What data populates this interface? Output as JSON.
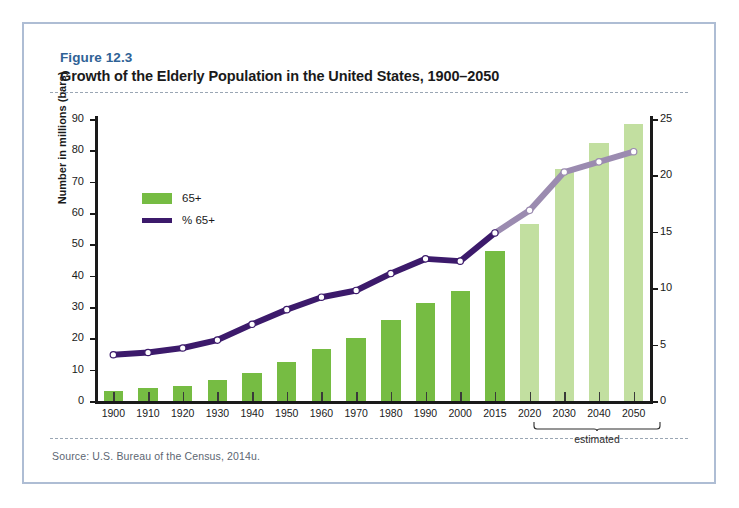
{
  "figure": {
    "number": "Figure 12.3",
    "title": "Growth of the Elderly Population in the United States, 1900–2050",
    "source": "Source:  U.S. Bureau of the Census, 2014u."
  },
  "annotations": {
    "estimated_label": "estimated",
    "estimated_years": [
      "2020",
      "2030",
      "2040",
      "2050"
    ]
  },
  "colors": {
    "bar_actual": "#76bc43",
    "bar_projected": "#c2dfa0",
    "line_actual": "#3c1a6b",
    "line_projected": "#9b8bb0",
    "frame": "#aebdd4",
    "figure_number": "#2f6296",
    "gridline": "#e2e2e2",
    "source_text": "#5c6672"
  },
  "chart_data": {
    "type": "bar",
    "title": "Growth of the Elderly Population in the United States, 1900–2050",
    "xlabel": "",
    "ylabel": "Number in millions (bars)",
    "ylabel_right": "Percentage of population 65 and older",
    "categories": [
      "1900",
      "1910",
      "1920",
      "1930",
      "1940",
      "1950",
      "1960",
      "1970",
      "1980",
      "1990",
      "2000",
      "2015",
      "2020",
      "2030",
      "2040",
      "2050"
    ],
    "ylim": [
      0,
      90
    ],
    "yticks": [
      0,
      10,
      20,
      30,
      40,
      50,
      60,
      70,
      80,
      90
    ],
    "ylim_right": [
      0,
      25
    ],
    "yticks_right": [
      0,
      5,
      10,
      15,
      20,
      25
    ],
    "grid": true,
    "legend": [
      "65+",
      "% 65+"
    ],
    "legend_position": "upper-left-inside",
    "series": [
      {
        "name": "65+",
        "kind": "bar",
        "unit": "millions",
        "axis": "left",
        "values": [
          3.1,
          4.0,
          4.9,
          6.7,
          9.0,
          12.4,
          16.7,
          20.1,
          25.7,
          31.2,
          35.0,
          47.8,
          56.4,
          74.1,
          82.3,
          88.5
        ],
        "projected_from": "2020"
      },
      {
        "name": "% 65+",
        "kind": "line",
        "unit": "percent",
        "axis": "right",
        "values": [
          4.1,
          4.3,
          4.7,
          5.4,
          6.8,
          8.1,
          9.2,
          9.8,
          11.3,
          12.6,
          12.4,
          14.9,
          16.9,
          20.3,
          21.2,
          22.1
        ],
        "projected_from": "2015"
      }
    ]
  }
}
